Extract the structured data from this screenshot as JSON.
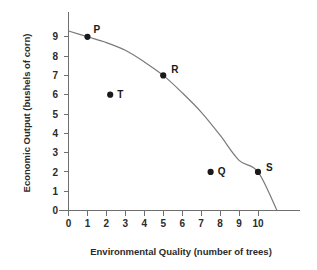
{
  "chart_data": {
    "type": "scatter",
    "title": "",
    "xlabel": "Environmental Quality (number of trees)",
    "ylabel": "Economic Output (bushels of corn)",
    "xlim": [
      0,
      11.6
    ],
    "ylim": [
      0,
      9.8
    ],
    "xticks": [
      "0",
      "1",
      "2",
      "3",
      "4",
      "5",
      "6",
      "7",
      "8",
      "9",
      "10"
    ],
    "xtick_values": [
      0,
      1,
      2,
      3,
      4,
      5,
      6,
      7,
      8,
      9,
      10
    ],
    "yticks": [
      "0",
      "1",
      "2",
      "3",
      "4",
      "5",
      "6",
      "7",
      "8",
      "9"
    ],
    "ytick_values": [
      0,
      1,
      2,
      3,
      4,
      5,
      6,
      7,
      8,
      9
    ],
    "grid": false,
    "legend": "none",
    "series": [
      {
        "name": "Production Possibilities Frontier",
        "type": "line",
        "x": [
          0,
          1,
          2,
          3,
          4,
          5,
          6,
          7,
          8,
          9,
          10,
          11
        ],
        "y": [
          9.3,
          9.0,
          8.7,
          8.3,
          7.7,
          7.0,
          6.1,
          5.1,
          3.9,
          2.6,
          2.0,
          0.0
        ]
      },
      {
        "name": "Labeled Points",
        "type": "scatter",
        "points": [
          {
            "label": "P",
            "x": 1,
            "y": 9,
            "on_curve": true,
            "label_dx": 6,
            "label_dy": -4
          },
          {
            "label": "T",
            "x": 2.2,
            "y": 6,
            "on_curve": false,
            "label_dx": 7,
            "label_dy": 3
          },
          {
            "label": "R",
            "x": 5,
            "y": 7,
            "on_curve": true,
            "label_dx": 8,
            "label_dy": -2
          },
          {
            "label": "Q",
            "x": 7.5,
            "y": 2,
            "on_curve": false,
            "label_dx": 7,
            "label_dy": 3
          },
          {
            "label": "S",
            "x": 10,
            "y": 2,
            "on_curve": true,
            "label_dx": 8,
            "label_dy": -1
          }
        ]
      }
    ]
  },
  "axes": {
    "x_title": "Environmental Quality (number of trees)",
    "y_title": "Economic Output (bushels of corn)"
  },
  "colors": {
    "background": "#ffffff",
    "axis": "#6f6f6f",
    "curve": "#7a7a7a",
    "point": "#1a1a1a",
    "text": "#2b2b2b"
  }
}
